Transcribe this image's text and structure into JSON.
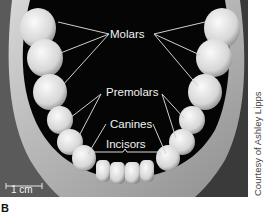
{
  "figure": {
    "panel_letter": "B",
    "credit": "Courtesy of Ashley Lipps",
    "scale_bar": {
      "label": "1 cm"
    },
    "labels": {
      "molars": "Molars",
      "premolars": "Premolars",
      "canines": "Canines",
      "incisors": "Incisors"
    },
    "colors": {
      "background": "#050505",
      "tooth": "#e6e6e6",
      "gum": "#b5b5b5",
      "leader_line": "#d0d0d0"
    }
  }
}
